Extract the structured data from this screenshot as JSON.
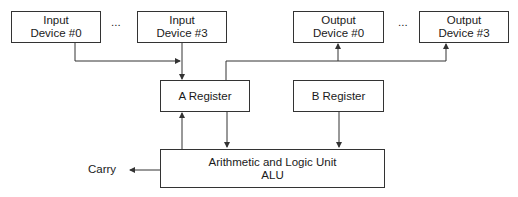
{
  "diagram": {
    "input_devices": [
      {
        "line1": "Input",
        "line2": "Device #0"
      },
      {
        "line1": "Input",
        "line2": "Device #3"
      }
    ],
    "output_devices": [
      {
        "line1": "Output",
        "line2": "Device #0"
      },
      {
        "line1": "Output",
        "line2": "Device #3"
      }
    ],
    "ellipsis": "...",
    "a_register": "A Register",
    "b_register": "B Register",
    "alu": {
      "line1": "Arithmetic and Logic Unit",
      "line2": "ALU"
    },
    "carry": "Carry",
    "line_color": "#333333",
    "caption_partial": "Diagram of a simple accumulator-based processor"
  }
}
